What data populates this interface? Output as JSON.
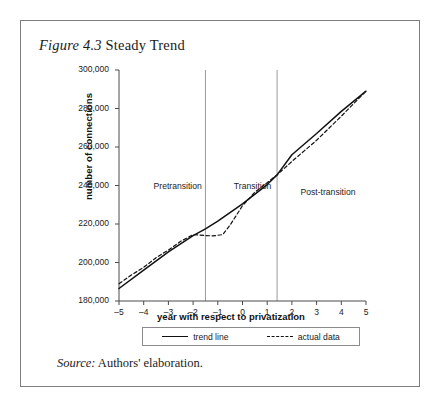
{
  "figure": {
    "number": "Figure 4.3",
    "title": "Steady Trend",
    "source_label": "Source:",
    "source_text": "Authors' elaboration."
  },
  "chart_data": {
    "type": "line",
    "title": "Steady Trend",
    "xlabel": "year with respect to privatization",
    "ylabel": "number of connections",
    "xlim": [
      -5,
      5
    ],
    "ylim": [
      180000,
      300000
    ],
    "xticks": [
      -5,
      -4,
      -3,
      -2,
      -1,
      0,
      1,
      2,
      3,
      4,
      5
    ],
    "xtick_labels": [
      "–5",
      "–4",
      "–3",
      "–2",
      "–1",
      "0",
      "1",
      "2",
      "3",
      "4",
      "5"
    ],
    "yticks": [
      180000,
      200000,
      220000,
      240000,
      260000,
      280000,
      300000
    ],
    "ytick_labels": [
      "180,000",
      "200,000",
      "220,000",
      "240,000",
      "260,000",
      "280,000",
      "300,000"
    ],
    "grid": false,
    "legend_position": "bottom",
    "series": [
      {
        "name": "trend line",
        "style": "solid",
        "color": "#111111",
        "x": [
          -5,
          -4,
          -3,
          -2,
          -1.5,
          -1,
          0,
          1,
          1.4,
          2,
          3,
          4,
          5
        ],
        "values": [
          186500,
          196000,
          205500,
          214000,
          217500,
          221500,
          230500,
          240500,
          245500,
          256000,
          267000,
          278500,
          289000
        ]
      },
      {
        "name": "actual data",
        "style": "dashed",
        "color": "#111111",
        "x": [
          -5,
          -4.5,
          -4,
          -3.5,
          -3,
          -2.5,
          -2,
          -1.5,
          -1.2,
          -0.8,
          -0.5,
          0,
          0.5,
          1,
          1.4,
          2,
          2.5,
          3,
          4,
          5
        ],
        "values": [
          189000,
          193500,
          197500,
          202500,
          206500,
          211000,
          214500,
          214000,
          213800,
          214500,
          219500,
          229500,
          236500,
          241500,
          245500,
          252500,
          258000,
          263500,
          276000,
          289000
        ]
      }
    ],
    "annotations": [
      {
        "name": "pretransition",
        "label": "Pretransition",
        "x": -3.6,
        "y": 239000
      },
      {
        "name": "transition",
        "label": "Transition",
        "x": -0.35,
        "y": 239000
      },
      {
        "name": "post-transition",
        "label": "Post-transition",
        "x": 2.35,
        "y": 236000
      }
    ],
    "vertical_dividers": [
      {
        "name": "pretransition-transition-divider",
        "x": -1.5
      },
      {
        "name": "transition-posttransition-divider",
        "x": 1.4
      }
    ]
  }
}
